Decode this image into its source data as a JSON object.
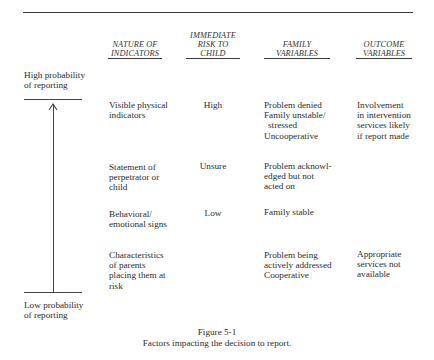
{
  "figure": {
    "label": "Figure 5-1",
    "caption": "Factors impacting the decision to report."
  },
  "axis": {
    "top_label": [
      "High probability",
      "of reporting"
    ],
    "bottom_label": [
      "Low probability",
      "of reporting"
    ],
    "arrow_direction": "up"
  },
  "columns": [
    {
      "lines": [
        "NATURE OF",
        "INDICATORS"
      ]
    },
    {
      "lines": [
        "IMMEDIATE",
        "RISK TO",
        "CHILD"
      ]
    },
    {
      "lines": [
        "FAMILY",
        "VARIABLES"
      ]
    },
    {
      "lines": [
        "OUTCOME",
        "VARIABLES"
      ]
    }
  ],
  "rows": [
    {
      "nature": [
        "Visible physical",
        "indicators"
      ],
      "risk": "High",
      "family": [
        "Problem denied",
        "Family unstable/",
        "stressed",
        "Uncooperative"
      ],
      "outcome": [
        "Involvement",
        "in intervention",
        "services likely",
        "if report made"
      ]
    },
    {
      "nature": [
        "Statement of",
        "perpetrator or",
        "child"
      ],
      "risk": "Unsure",
      "family": [
        "Problem acknowl-",
        "edged but not",
        "acted on"
      ],
      "outcome": []
    },
    {
      "nature": [
        "Behavioral/",
        "emotional signs"
      ],
      "risk": "Low",
      "family": [
        "Family stable"
      ],
      "outcome": []
    },
    {
      "nature": [
        "Characteristics",
        "of parents",
        "placing them at",
        "risk"
      ],
      "risk": "",
      "family": [
        "Problem being",
        "actively addressed",
        "Cooperative"
      ],
      "outcome": [
        "Appropriate",
        "services not",
        "available"
      ]
    }
  ]
}
